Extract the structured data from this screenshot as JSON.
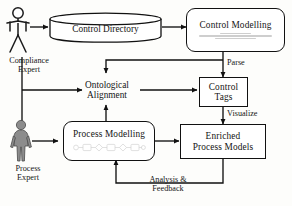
{
  "diagram": {
    "background_color": "#fdfdfb",
    "line_color": "#111111",
    "text_color": "#141414",
    "nodes": {
      "control_directory": {
        "label": "Control Directory",
        "shape": "cylinder"
      },
      "control_modelling": {
        "label": "Control Modelling",
        "shape": "rounded-rectangle",
        "detail": "illegible-formula-text"
      },
      "ontological_alignment": {
        "line1": "Ontological",
        "line2": "Alignment",
        "shape": "plain-text"
      },
      "control_tags": {
        "line1": "Control",
        "line2": "Tags",
        "shape": "rectangle"
      },
      "process_modelling": {
        "label": "Process Modelling",
        "shape": "rounded-rectangle",
        "detail": "illegible-bpmn-sketch"
      },
      "enriched_process_models": {
        "line1": "Enriched",
        "line2": "Process Models",
        "shape": "rectangle"
      }
    },
    "actors": {
      "compliance_expert": {
        "line1": "Compliance",
        "line2": "Expert",
        "style": "outline-figure",
        "fill": "#ffffff"
      },
      "process_expert": {
        "line1": "Process",
        "line2": "Expert",
        "style": "filled-figure",
        "fill": "#8c8c8c"
      }
    },
    "edge_labels": {
      "parse": "Parse",
      "visualize": "Visualize",
      "analysis_feedback_line1": "Analysis &",
      "analysis_feedback_line2": "Feedback"
    }
  }
}
